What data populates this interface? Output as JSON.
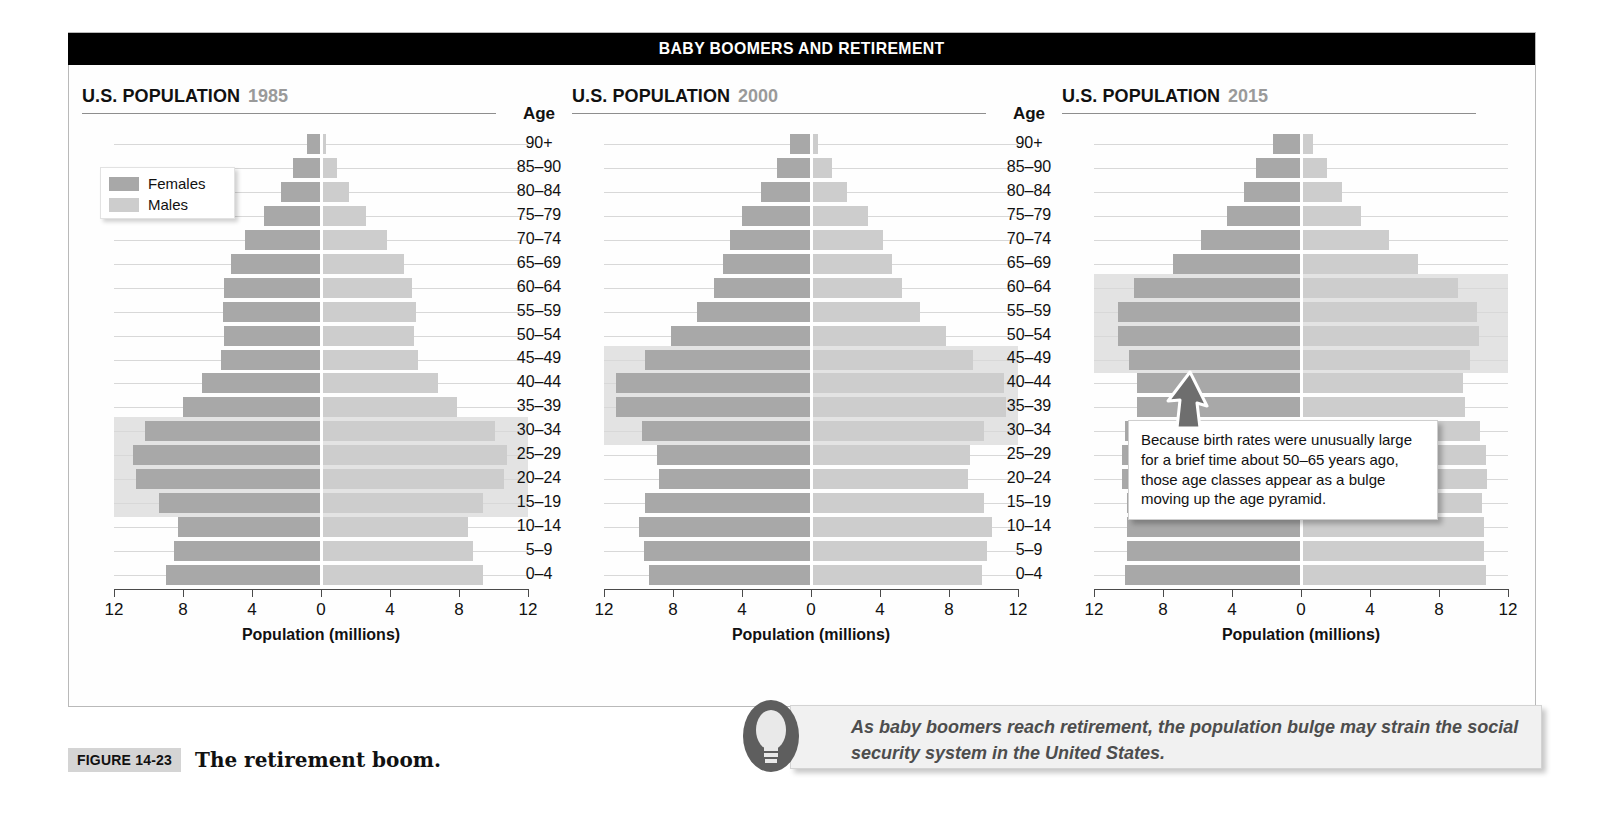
{
  "banner": {
    "title": "BABY BOOMERS AND RETIREMENT"
  },
  "legend": {
    "females_label": "Females",
    "males_label": "Males",
    "female_color": "#a8a8a8",
    "male_color": "#cdcdcd"
  },
  "age_header": "Age",
  "age_labels": [
    "90+",
    "85–90",
    "80–84",
    "75–79",
    "70–74",
    "65–69",
    "60–64",
    "55–59",
    "50–54",
    "45–49",
    "40–44",
    "35–39",
    "30–34",
    "25–29",
    "20–24",
    "15–19",
    "10–14",
    "5–9",
    "0–4"
  ],
  "panels": [
    {
      "title": "U.S. POPULATION",
      "year": "1985",
      "xtitle": "Population (millions)"
    },
    {
      "title": "U.S. POPULATION",
      "year": "2000",
      "xtitle": "Population (millions)"
    },
    {
      "title": "U.S. POPULATION",
      "year": "2015",
      "xtitle": "Population (millions)"
    }
  ],
  "callout": {
    "text": "Because birth rates were unusually large for a brief time about 50–65 years ago, those age classes appear as a bulge moving up the age pyramid."
  },
  "tip": {
    "text": "As baby boomers reach retirement, the population bulge may strain the social security system in the United States.",
    "icon": "lightbulb-icon"
  },
  "figure": {
    "tag": "FIGURE 14-23",
    "caption": "The retirement boom."
  },
  "chart_data": [
    {
      "type": "bar",
      "title": "U.S. POPULATION 1985",
      "subtitle": "Population pyramid",
      "xlabel": "Population (millions)",
      "ylabel": "Age",
      "xlim": [
        -12,
        12
      ],
      "xticks": [
        12,
        8,
        4,
        0,
        4,
        8,
        12
      ],
      "grid": true,
      "orientation": "horizontal-diverging",
      "categories": [
        "90+",
        "85–90",
        "80–84",
        "75–79",
        "70–74",
        "65–69",
        "60–64",
        "55–59",
        "50–54",
        "45–49",
        "40–44",
        "35–39",
        "30–34",
        "25–29",
        "20–24",
        "15–19",
        "10–14",
        "5–9",
        "0–4"
      ],
      "series": [
        {
          "name": "Females",
          "side": "left",
          "values": [
            0.8,
            1.6,
            2.3,
            3.3,
            4.4,
            5.2,
            5.6,
            5.7,
            5.6,
            5.8,
            6.9,
            8.0,
            10.2,
            10.9,
            10.7,
            9.4,
            8.3,
            8.5,
            9.0
          ]
        },
        {
          "name": "Males",
          "side": "right",
          "values": [
            0.3,
            0.9,
            1.6,
            2.6,
            3.8,
            4.8,
            5.3,
            5.5,
            5.4,
            5.6,
            6.8,
            7.9,
            10.1,
            10.8,
            10.6,
            9.4,
            8.5,
            8.8,
            9.4
          ]
        }
      ],
      "highlight_band": {
        "from": "30–34",
        "to": "15–19",
        "label": "baby boom cohort"
      }
    },
    {
      "type": "bar",
      "title": "U.S. POPULATION 2000",
      "subtitle": "Population pyramid",
      "xlabel": "Population (millions)",
      "ylabel": "Age",
      "xlim": [
        -12,
        12
      ],
      "xticks": [
        12,
        8,
        4,
        0,
        4,
        8,
        12
      ],
      "grid": true,
      "orientation": "horizontal-diverging",
      "categories": [
        "90+",
        "85–90",
        "80–84",
        "75–79",
        "70–74",
        "65–69",
        "60–64",
        "55–59",
        "50–54",
        "45–49",
        "40–44",
        "35–39",
        "30–34",
        "25–29",
        "20–24",
        "15–19",
        "10–14",
        "5–9",
        "0–4"
      ],
      "series": [
        {
          "name": "Females",
          "side": "left",
          "values": [
            1.2,
            2.0,
            2.9,
            4.0,
            4.7,
            5.1,
            5.6,
            6.6,
            8.1,
            9.6,
            11.3,
            11.3,
            9.8,
            8.9,
            8.8,
            9.6,
            10.0,
            9.7,
            9.4
          ]
        },
        {
          "name": "Males",
          "side": "right",
          "values": [
            0.4,
            1.2,
            2.1,
            3.3,
            4.2,
            4.7,
            5.3,
            6.3,
            7.8,
            9.4,
            11.2,
            11.3,
            10.0,
            9.2,
            9.1,
            10.0,
            10.5,
            10.2,
            9.9
          ]
        }
      ],
      "highlight_band": {
        "from": "45–49",
        "to": "30–34",
        "label": "baby boom cohort"
      }
    },
    {
      "type": "bar",
      "title": "U.S. POPULATION 2015",
      "subtitle": "Population pyramid",
      "xlabel": "Population (millions)",
      "ylabel": "Age",
      "xlim": [
        -12,
        12
      ],
      "xticks": [
        12,
        8,
        4,
        0,
        4,
        8,
        12
      ],
      "grid": true,
      "orientation": "horizontal-diverging",
      "categories": [
        "90+",
        "85–90",
        "80–84",
        "75–79",
        "70–74",
        "65–69",
        "60–64",
        "55–59",
        "50–54",
        "45–49",
        "40–44",
        "35–39",
        "30–34",
        "25–29",
        "20–24",
        "15–19",
        "10–14",
        "5–9",
        "0–4"
      ],
      "series": [
        {
          "name": "Females",
          "side": "left",
          "values": [
            1.6,
            2.6,
            3.3,
            4.3,
            5.8,
            7.4,
            9.7,
            10.6,
            10.6,
            10.0,
            9.5,
            9.5,
            10.2,
            10.4,
            10.4,
            10.1,
            10.1,
            10.1,
            10.2
          ]
        },
        {
          "name": "Males",
          "side": "right",
          "values": [
            0.7,
            1.5,
            2.4,
            3.5,
            5.1,
            6.8,
            9.1,
            10.2,
            10.3,
            9.8,
            9.4,
            9.5,
            10.4,
            10.7,
            10.8,
            10.5,
            10.6,
            10.6,
            10.7
          ]
        }
      ],
      "highlight_band": {
        "from": "60–64",
        "to": "45–49",
        "label": "baby boom cohort"
      }
    }
  ]
}
